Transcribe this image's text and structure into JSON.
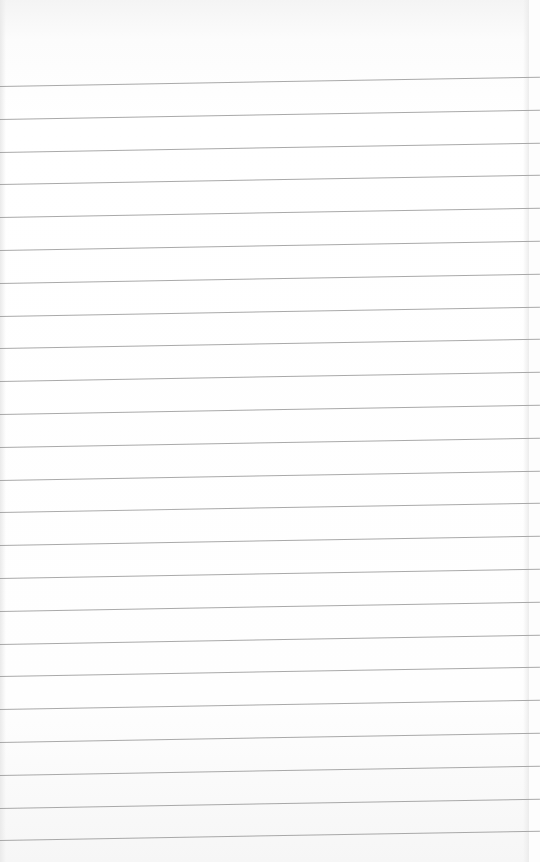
{
  "paper": {
    "type": "lined-notebook-paper",
    "line_count": 24,
    "first_line_y": 86,
    "line_spacing": 32.8,
    "line_color": "#9a9a9a",
    "background_color": "#fdfdfd"
  }
}
